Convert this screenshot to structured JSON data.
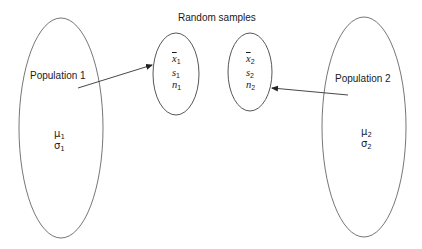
{
  "title": "Random samples",
  "populations": [
    {
      "label": "Population 1",
      "mean_symbol": "μ",
      "sd_symbol": "σ",
      "index": "1"
    },
    {
      "label": "Population 2",
      "mean_symbol": "μ",
      "sd_symbol": "σ",
      "index": "2"
    }
  ],
  "samples": [
    {
      "mean_symbol": "x",
      "sd_symbol": "s",
      "size_symbol": "n",
      "index": "1"
    },
    {
      "mean_symbol": "x",
      "sd_symbol": "s",
      "size_symbol": "n",
      "index": "2"
    }
  ],
  "colors": {
    "stroke": "#555555",
    "text": "#1a1a1a",
    "background": "#ffffff"
  }
}
